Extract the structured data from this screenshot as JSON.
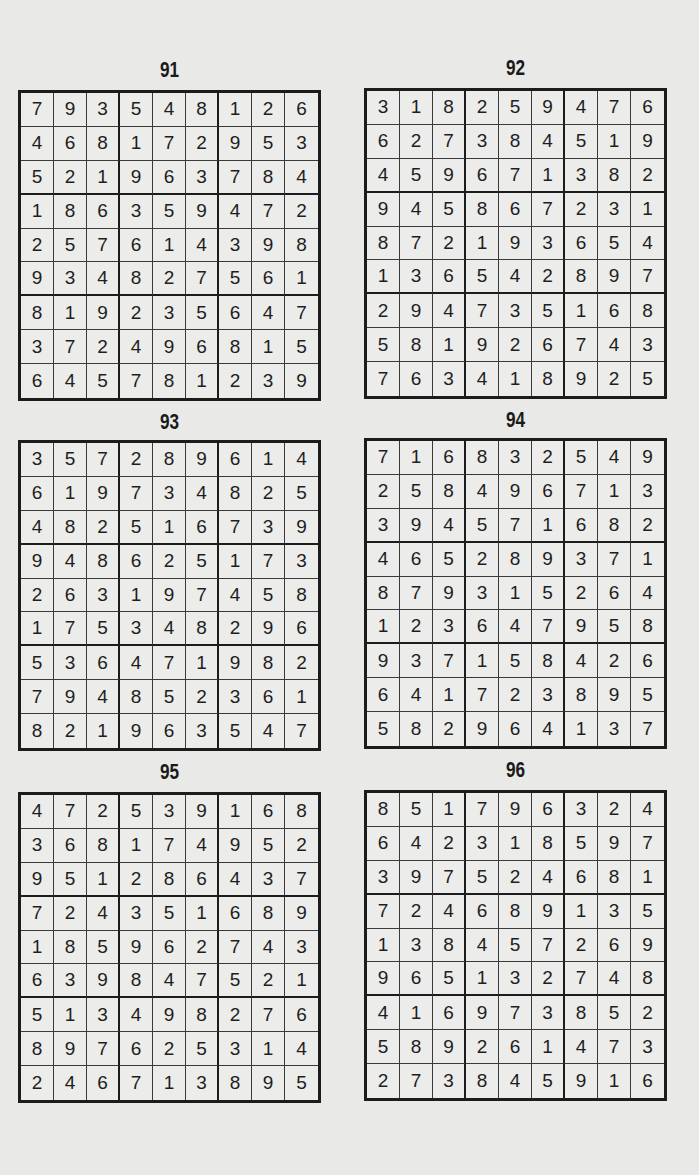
{
  "page": {
    "background": "#e9e9e7",
    "ink": "#1c1c1c"
  },
  "puzzles": [
    {
      "title": "91",
      "grid": [
        [
          7,
          9,
          3,
          5,
          4,
          8,
          1,
          2,
          6
        ],
        [
          4,
          6,
          8,
          1,
          7,
          2,
          9,
          5,
          3
        ],
        [
          5,
          2,
          1,
          9,
          6,
          3,
          7,
          8,
          4
        ],
        [
          1,
          8,
          6,
          3,
          5,
          9,
          4,
          7,
          2
        ],
        [
          2,
          5,
          7,
          6,
          1,
          4,
          3,
          9,
          8
        ],
        [
          9,
          3,
          4,
          8,
          2,
          7,
          5,
          6,
          1
        ],
        [
          8,
          1,
          9,
          2,
          3,
          5,
          6,
          4,
          7
        ],
        [
          3,
          7,
          2,
          4,
          9,
          6,
          8,
          1,
          5
        ],
        [
          6,
          4,
          5,
          7,
          8,
          1,
          2,
          3,
          9
        ]
      ]
    },
    {
      "title": "92",
      "grid": [
        [
          3,
          1,
          8,
          2,
          5,
          9,
          4,
          7,
          6
        ],
        [
          6,
          2,
          7,
          3,
          8,
          4,
          5,
          1,
          9
        ],
        [
          4,
          5,
          9,
          6,
          7,
          1,
          3,
          8,
          2
        ],
        [
          9,
          4,
          5,
          8,
          6,
          7,
          2,
          3,
          1
        ],
        [
          8,
          7,
          2,
          1,
          9,
          3,
          6,
          5,
          4
        ],
        [
          1,
          3,
          6,
          5,
          4,
          2,
          8,
          9,
          7
        ],
        [
          2,
          9,
          4,
          7,
          3,
          5,
          1,
          6,
          8
        ],
        [
          5,
          8,
          1,
          9,
          2,
          6,
          7,
          4,
          3
        ],
        [
          7,
          6,
          3,
          4,
          1,
          8,
          9,
          2,
          5
        ]
      ]
    },
    {
      "title": "93",
      "grid": [
        [
          3,
          5,
          7,
          2,
          8,
          9,
          6,
          1,
          4
        ],
        [
          6,
          1,
          9,
          7,
          3,
          4,
          8,
          2,
          5
        ],
        [
          4,
          8,
          2,
          5,
          1,
          6,
          7,
          3,
          9
        ],
        [
          9,
          4,
          8,
          6,
          2,
          5,
          1,
          7,
          3
        ],
        [
          2,
          6,
          3,
          1,
          9,
          7,
          4,
          5,
          8
        ],
        [
          1,
          7,
          5,
          3,
          4,
          8,
          2,
          9,
          6
        ],
        [
          5,
          3,
          6,
          4,
          7,
          1,
          9,
          8,
          2
        ],
        [
          7,
          9,
          4,
          8,
          5,
          2,
          3,
          6,
          1
        ],
        [
          8,
          2,
          1,
          9,
          6,
          3,
          5,
          4,
          7
        ]
      ]
    },
    {
      "title": "94",
      "grid": [
        [
          7,
          1,
          6,
          8,
          3,
          2,
          5,
          4,
          9
        ],
        [
          2,
          5,
          8,
          4,
          9,
          6,
          7,
          1,
          3
        ],
        [
          3,
          9,
          4,
          5,
          7,
          1,
          6,
          8,
          2
        ],
        [
          4,
          6,
          5,
          2,
          8,
          9,
          3,
          7,
          1
        ],
        [
          8,
          7,
          9,
          3,
          1,
          5,
          2,
          6,
          4
        ],
        [
          1,
          2,
          3,
          6,
          4,
          7,
          9,
          5,
          8
        ],
        [
          9,
          3,
          7,
          1,
          5,
          8,
          4,
          2,
          6
        ],
        [
          6,
          4,
          1,
          7,
          2,
          3,
          8,
          9,
          5
        ],
        [
          5,
          8,
          2,
          9,
          6,
          4,
          1,
          3,
          7
        ]
      ]
    },
    {
      "title": "95",
      "grid": [
        [
          4,
          7,
          2,
          5,
          3,
          9,
          1,
          6,
          8
        ],
        [
          3,
          6,
          8,
          1,
          7,
          4,
          9,
          5,
          2
        ],
        [
          9,
          5,
          1,
          2,
          8,
          6,
          4,
          3,
          7
        ],
        [
          7,
          2,
          4,
          3,
          5,
          1,
          6,
          8,
          9
        ],
        [
          1,
          8,
          5,
          9,
          6,
          2,
          7,
          4,
          3
        ],
        [
          6,
          3,
          9,
          8,
          4,
          7,
          5,
          2,
          1
        ],
        [
          5,
          1,
          3,
          4,
          9,
          8,
          2,
          7,
          6
        ],
        [
          8,
          9,
          7,
          6,
          2,
          5,
          3,
          1,
          4
        ],
        [
          2,
          4,
          6,
          7,
          1,
          3,
          8,
          9,
          5
        ]
      ]
    },
    {
      "title": "96",
      "grid": [
        [
          8,
          5,
          1,
          7,
          9,
          6,
          3,
          2,
          4
        ],
        [
          6,
          4,
          2,
          3,
          1,
          8,
          5,
          9,
          7
        ],
        [
          3,
          9,
          7,
          5,
          2,
          4,
          6,
          8,
          1
        ],
        [
          7,
          2,
          4,
          6,
          8,
          9,
          1,
          3,
          5
        ],
        [
          1,
          3,
          8,
          4,
          5,
          7,
          2,
          6,
          9
        ],
        [
          9,
          6,
          5,
          1,
          3,
          2,
          7,
          4,
          8
        ],
        [
          4,
          1,
          6,
          9,
          7,
          3,
          8,
          5,
          2
        ],
        [
          5,
          8,
          9,
          2,
          6,
          1,
          4,
          7,
          3
        ],
        [
          2,
          7,
          3,
          8,
          4,
          5,
          9,
          1,
          6
        ]
      ]
    }
  ]
}
